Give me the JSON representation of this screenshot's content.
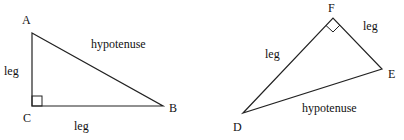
{
  "triangles": [
    {
      "name": "ABC",
      "vertices": {
        "A": {
          "label": "A",
          "x": 32,
          "y": 33
        },
        "B": {
          "label": "B",
          "x": 163,
          "y": 106
        },
        "C": {
          "label": "C",
          "x": 32,
          "y": 106
        }
      },
      "right_angle_at": "C",
      "side_labels": {
        "AC": "leg",
        "CB": "leg",
        "AB": "hypotenuse"
      }
    },
    {
      "name": "DEF",
      "vertices": {
        "D": {
          "label": "D",
          "x": 243,
          "y": 113
        },
        "E": {
          "label": "E",
          "x": 382,
          "y": 69
        },
        "F": {
          "label": "F",
          "x": 333,
          "y": 18
        }
      },
      "right_angle_at": "F",
      "side_labels": {
        "DF": "leg",
        "FE": "leg",
        "DE": "hypotenuse"
      }
    }
  ],
  "colors": {
    "stroke": "#222222",
    "text": "#111111",
    "background": "#ffffff"
  }
}
